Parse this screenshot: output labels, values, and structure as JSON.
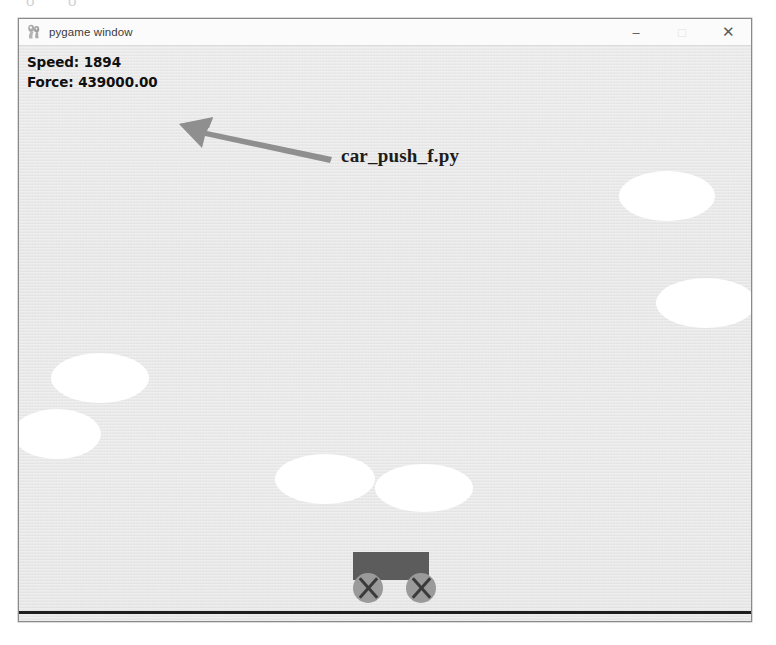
{
  "page": {
    "background_color": "#ffffff",
    "scan_artifacts": [
      "o",
      "o"
    ]
  },
  "window": {
    "title": "pygame window",
    "icon": "pygame-logo-icon",
    "controls": [
      {
        "name": "minimize",
        "glyph": "–"
      },
      {
        "name": "maximize",
        "glyph": "□"
      },
      {
        "name": "close",
        "glyph": "✕"
      }
    ]
  },
  "hud": {
    "speed_label": "Speed: 1894",
    "force_label": "Force: 439000.00",
    "speed_value": 1894,
    "force_value": "439000.00",
    "text_color": "#101010"
  },
  "scene": {
    "sky_color": "#e9e9e9",
    "cloud_color": "#ffffff",
    "ground_color": "#1d1d1d",
    "clouds": [
      {
        "id": "cloud-right-upper",
        "left": 600,
        "top": 125,
        "width": 96,
        "height": 50
      },
      {
        "id": "cloud-right-lower",
        "left": 637,
        "top": 232,
        "width": 100,
        "height": 50
      },
      {
        "id": "cloud-left-upper",
        "left": 32,
        "top": 307,
        "width": 98,
        "height": 50
      },
      {
        "id": "cloud-left-lower",
        "left": -6,
        "top": 363,
        "width": 88,
        "height": 50
      },
      {
        "id": "cloud-mid-left",
        "left": 256,
        "top": 408,
        "width": 100,
        "height": 50
      },
      {
        "id": "cloud-mid-right",
        "left": 356,
        "top": 418,
        "width": 98,
        "height": 48
      }
    ]
  },
  "car": {
    "body_color": "#5c5c5c",
    "wheel_color": "#9a9a9a",
    "spoke_color": "#3a3a3a"
  },
  "annotation": {
    "label": "car_push_f.py",
    "arrow_color": "#8c8c8c",
    "arrow_direction": "left"
  }
}
